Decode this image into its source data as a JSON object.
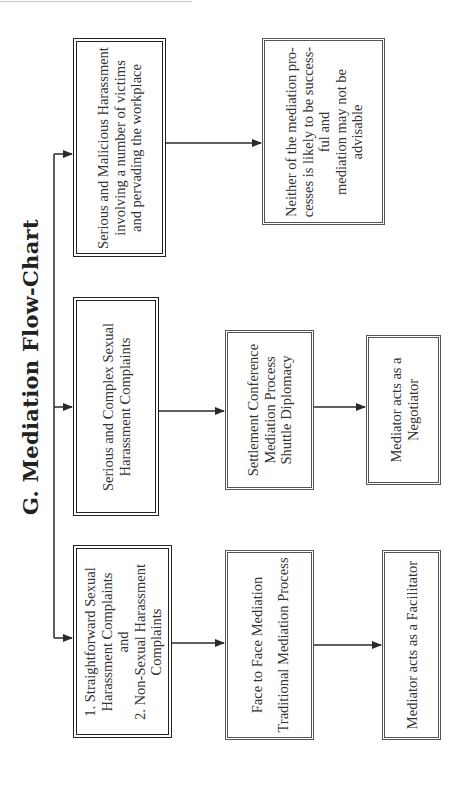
{
  "title": "G.  Mediation Flow-Chart",
  "colors": {
    "line": "#2a2a2a",
    "box_border": "#555555",
    "text": "#333333"
  },
  "columns": [
    {
      "category": {
        "lines": [
          "1. Straightforward Sexual",
          "Harassment Complaints",
          "and",
          "2. Non-Sexual Harassment",
          "Complaints"
        ]
      },
      "process": {
        "lines": [
          "Face to Face Mediation",
          "",
          "Traditional Mediation Process"
        ]
      },
      "role": {
        "lines": [
          "Mediator acts as a Facilitator"
        ]
      }
    },
    {
      "category": {
        "lines": [
          "Serious and Complex Sexual",
          "Harassment Complaints"
        ]
      },
      "process": {
        "lines": [
          "Settlement Conference",
          "Mediation Process",
          "Shuttle Diplomacy"
        ]
      },
      "role": {
        "lines": [
          "Mediator acts as a",
          "Negotiator"
        ]
      }
    },
    {
      "category": {
        "lines": [
          "Serious and Malicious Harassment",
          "involving a number of victims",
          "and pervading the workplace"
        ]
      },
      "outcome": {
        "lines": [
          "Neither of the mediation pro-",
          "cesses is likely to be success-",
          "ful and",
          "mediation may not be",
          "advisable"
        ]
      }
    }
  ]
}
